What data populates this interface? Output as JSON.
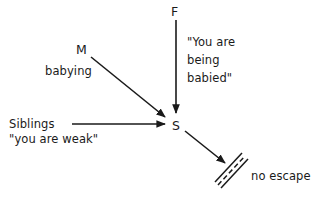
{
  "diagram": {
    "nodes": [
      {
        "id": "F",
        "label": "F"
      },
      {
        "id": "M",
        "label": "M"
      },
      {
        "id": "Siblings",
        "label": "Siblings"
      },
      {
        "id": "S",
        "label": "S"
      }
    ],
    "edges": [
      {
        "from": "F",
        "to": "S",
        "label_lines": [
          "\"You are",
          "being",
          "babied\""
        ]
      },
      {
        "from": "M",
        "to": "S",
        "label": "babying"
      },
      {
        "from": "Siblings",
        "to": "S",
        "label": "\"you are weak\""
      },
      {
        "from": "S",
        "to": "barrier",
        "label": "no escape"
      }
    ],
    "labels": {
      "f": "F",
      "m": "M",
      "babying": "babying",
      "siblings": "Siblings",
      "you_are_weak": "\"you are weak\"",
      "s": "S",
      "babied_1": "\"You are",
      "babied_2": "being",
      "babied_3": "babied\"",
      "no_escape": "no escape"
    },
    "colors": {
      "ink": "#1a1a1a",
      "background": "#ffffff"
    }
  }
}
